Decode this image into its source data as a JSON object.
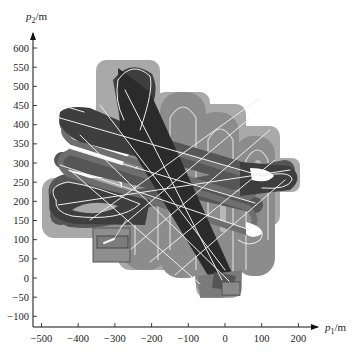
{
  "chart_data": {
    "type": "scatter",
    "title": "",
    "xlabel": "p1/m",
    "ylabel": "p2/m",
    "xlabel_parts": {
      "base": "p",
      "sub": "1",
      "unit": "/m"
    },
    "ylabel_parts": {
      "base": "p",
      "sub": "2",
      "unit": "/m"
    },
    "xlim": [
      -520,
      250
    ],
    "ylim": [
      -130,
      660
    ],
    "grid": false,
    "x_ticks": [
      -500,
      -400,
      -300,
      -200,
      -100,
      0,
      100,
      200
    ],
    "x_tick_labels": [
      "−500",
      "−400",
      "−300",
      "−200",
      "−100",
      "0",
      "100",
      "200"
    ],
    "y_ticks": [
      -100,
      -50,
      0,
      50,
      100,
      150,
      200,
      250,
      300,
      350,
      400,
      450,
      500,
      550,
      600
    ],
    "y_tick_labels": [
      "−100",
      "−50",
      "0",
      "50",
      "100",
      "150",
      "200",
      "250",
      "300",
      "350",
      "400",
      "450",
      "500",
      "550",
      "600"
    ],
    "series": [
      {
        "name": "vertical hairpin coverage (medium gray)",
        "color": "#8c8c8c",
        "description": "boustrophedon vertical loops from about x=-290 to x=40, y=60 to 510"
      },
      {
        "name": "horizontal loop coverage (dark gray)",
        "color": "#555555",
        "description": "horizontal loops from about x=-460 to x=180, y=150 to 420"
      },
      {
        "name": "diagonal band (darkest)",
        "color": "#2b2b2b",
        "description": "diagonal sweep from about (-230, 470) to (20, 20)"
      },
      {
        "name": "outer coverage envelope (light gray)",
        "color": "#a9a9a9"
      },
      {
        "name": "trajectory lines",
        "color": "#f2f2f2"
      }
    ],
    "annotations": [
      {
        "type": "rect",
        "label": "start region box",
        "x": [
          -335,
          -245
        ],
        "y": [
          45,
          130
        ]
      },
      {
        "type": "rect",
        "label": "end region box",
        "x": [
          -10,
          40
        ],
        "y": [
          -40,
          10
        ]
      }
    ]
  }
}
